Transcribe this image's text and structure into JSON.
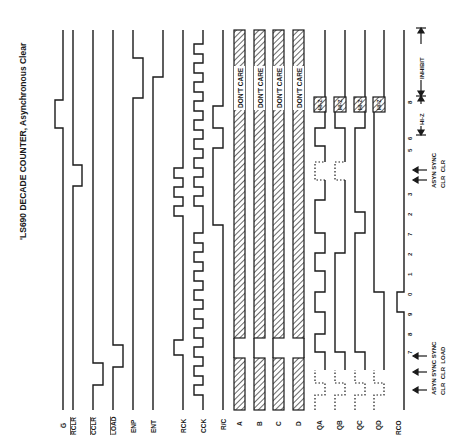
{
  "title": "'LS690 DECADE COUNTER, Asynchronous Clear",
  "signals": [
    {
      "name": "G",
      "label": "G̅",
      "overbar": true
    },
    {
      "name": "RCLR",
      "label": "RCLR",
      "overbar": true
    },
    {
      "name": "CCLR",
      "label": "CCLR",
      "overbar": true
    },
    {
      "name": "LOAD",
      "label": "LOAD",
      "overbar": true
    },
    {
      "name": "ENP",
      "label": "ENP",
      "overbar": false
    },
    {
      "name": "ENT",
      "label": "ENT",
      "overbar": false
    },
    {
      "name": "RCK",
      "label": "RCK",
      "overbar": false
    },
    {
      "name": "CCK",
      "label": "CCK",
      "overbar": false
    },
    {
      "name": "R/C",
      "label": "R/C",
      "overbar": false
    },
    {
      "name": "A",
      "label": "A",
      "overbar": false
    },
    {
      "name": "B",
      "label": "B",
      "overbar": false
    },
    {
      "name": "C",
      "label": "C",
      "overbar": false
    },
    {
      "name": "D",
      "label": "D",
      "overbar": false
    },
    {
      "name": "QA",
      "label": "QA",
      "overbar": false
    },
    {
      "name": "QB",
      "label": "QB",
      "overbar": false
    },
    {
      "name": "QC",
      "label": "QC",
      "overbar": false
    },
    {
      "name": "QD",
      "label": "QD",
      "overbar": false
    },
    {
      "name": "RCO",
      "label": "RCO",
      "overbar": false
    }
  ],
  "bus_labels": {
    "dont_care": "DON'T CARE",
    "hi_z": "HI-Z"
  },
  "count_sequence": [
    "7",
    "8",
    "9",
    "0",
    "1",
    "2",
    "7",
    "2",
    "3",
    "5",
    "6",
    "8"
  ],
  "annotations": {
    "group1": {
      "line1": "ASYN SYNC SYNC",
      "line2": "CLR  CLR  LOAD"
    },
    "group2": {
      "line1": "ASYN SYNC",
      "line2": "CLR  CLR"
    },
    "hi_z_span": "HI-Z",
    "inhibit_span": "INHIBIT"
  }
}
